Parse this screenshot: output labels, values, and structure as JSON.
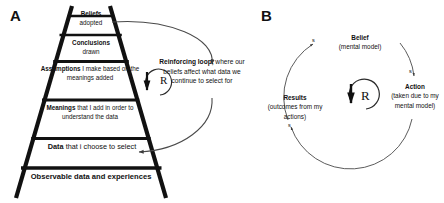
{
  "figure": {
    "background_color": "#ffffff",
    "line_color": "#111111",
    "panels": {
      "a": {
        "label": "A"
      },
      "b": {
        "label": "B"
      }
    }
  },
  "ladder": {
    "name": "ladder-of-inference",
    "rungs": [
      {
        "id": "beliefs",
        "bold": "Beliefs",
        "rest": "adopted"
      },
      {
        "id": "conclusions",
        "bold": "Conclusions",
        "rest": "drawn"
      },
      {
        "id": "assumptions",
        "bold": "Assumptions",
        "rest": "I make based on the meanings added"
      },
      {
        "id": "meanings",
        "bold": "Meanings",
        "rest": "that I add in order to understand the data"
      },
      {
        "id": "data",
        "bold": "Data",
        "rest": "that i choose to select"
      },
      {
        "id": "observable",
        "bold": "Observable data and experiences",
        "rest": ""
      }
    ],
    "rung_text": {
      "beliefs_bold": "Beliefs",
      "beliefs_rest": "adopted",
      "conclusions_bold": "Conclusions",
      "conclusions_rest": "drawn",
      "assumptions_bold": "Assumptions",
      "assumptions_rest": " I make based on the meanings added",
      "meanings_bold": "Meanings",
      "meanings_rest": " that I add in order to understand the data",
      "data_bold": "Data",
      "data_rest": " that i choose to select",
      "observable_bold": "Observable data and experiences"
    }
  },
  "reinforcing": {
    "bold_label": "Reinforcing loop,",
    "rest": " where our beliefs affect what data we continue to select for",
    "r_symbol": "R"
  },
  "loop_b": {
    "r_symbol": "R",
    "nodes": [
      {
        "id": "belief",
        "title": "Belief",
        "subtitle": "(mental model)"
      },
      {
        "id": "action",
        "title": "Action",
        "subtitle": "(taken due to my mental model)"
      },
      {
        "id": "results",
        "title": "Results",
        "subtitle": "(outcomes from my actions)"
      }
    ],
    "polarity_marks": {
      "belief_in": "s",
      "action": "s",
      "results": "s"
    }
  }
}
